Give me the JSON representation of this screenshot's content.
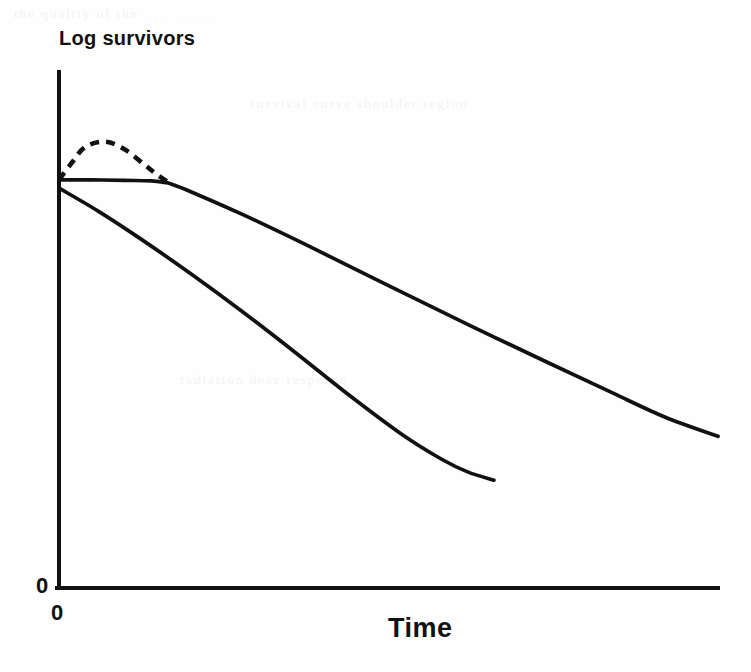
{
  "figure": {
    "kind": "line-diagram",
    "background_color": "#fefefe",
    "ink_color": "#111111"
  },
  "labels": {
    "y_axis_title": "Log survivors",
    "x_axis_title": "Time",
    "y_axis_zero": "0",
    "x_axis_zero": "0"
  },
  "artifacts": {
    "ghost_row_1": "the quality of the . . . . . . .",
    "ghost_row_2": "survival curve shoulder region",
    "ghost_row_3": "radiation dose response"
  },
  "chart_data": {
    "type": "line",
    "title": "",
    "xlabel": "Time",
    "ylabel": "Log survivors",
    "xlim": [
      0,
      100
    ],
    "ylim": [
      0,
      100
    ],
    "grid": false,
    "legend": "none",
    "xticks": [
      "0"
    ],
    "yticks": [
      "0"
    ],
    "axis_style": "two-line L-shaped axes, no tick marks, log-linear survival plot",
    "series": [
      {
        "name": "shouldered survival curve",
        "style": "solid",
        "description": "initial plateau (shoulder) followed by exponential decline",
        "x": [
          0,
          5,
          10,
          14,
          16,
          17,
          20,
          28,
          38,
          50,
          62,
          74,
          84,
          92,
          100
        ],
        "y": [
          79.1,
          79.1,
          79.0,
          78.9,
          78.6,
          78.3,
          76.8,
          72.3,
          66.2,
          58.6,
          51.1,
          43.8,
          37.8,
          33.1,
          29.4
        ]
      },
      {
        "name": "exponential survival curve",
        "style": "solid",
        "description": "immediate continuous decline, steepening then flattening tail",
        "x": [
          0,
          6,
          12,
          20,
          28,
          36,
          44,
          52,
          58,
          62,
          66
        ],
        "y": [
          77.5,
          73.0,
          68.0,
          60.9,
          53.4,
          45.5,
          37.4,
          29.8,
          25.0,
          22.5,
          20.9
        ]
      },
      {
        "name": "extrapolated shoulder arc",
        "style": "dashed",
        "description": "dashed arc rising above the plateau then rejoining the solid shoulder curve",
        "x": [
          0,
          2,
          4,
          7,
          10,
          13,
          15,
          17
        ],
        "y": [
          79.1,
          82.5,
          85.5,
          86.5,
          85.0,
          82.0,
          80.0,
          78.3
        ]
      }
    ]
  }
}
